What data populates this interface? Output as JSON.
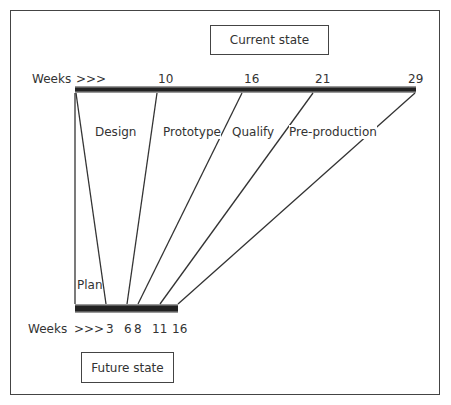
{
  "title_current": "Current state",
  "title_future": "Future state",
  "current_axis": {
    "label": "Weeks",
    "arrows": ">>>",
    "ticks": [
      "10",
      "16",
      "21",
      "29"
    ]
  },
  "future_axis": {
    "label": "Weeks",
    "arrows": ">>>",
    "ticks": [
      "3",
      "6",
      "8",
      "11",
      "16"
    ]
  },
  "phases": [
    "Plan",
    "Design",
    "Prototype",
    "Qualify",
    "Pre-production"
  ],
  "colors": {
    "line": "#333333",
    "bar": "#222222",
    "bar_edge": "#888888"
  }
}
